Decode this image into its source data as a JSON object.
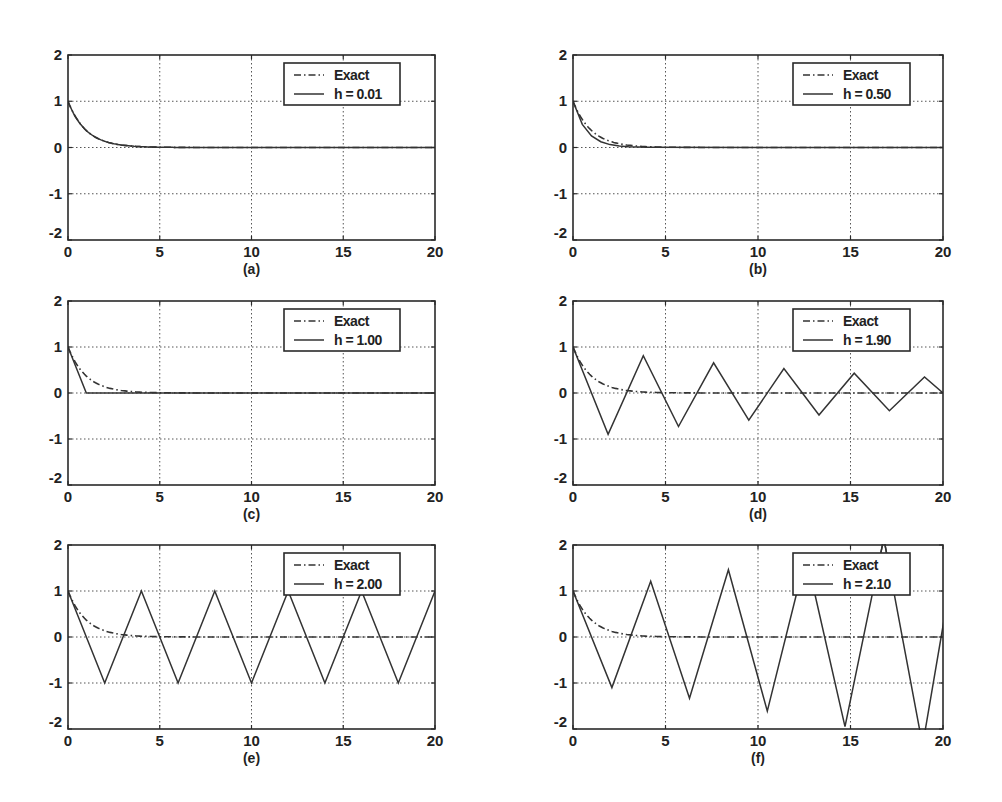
{
  "figure": {
    "legend_exact_label": "Exact"
  },
  "chart_data": [
    {
      "type": "line",
      "caption": "(a)",
      "xlim": [
        0,
        20
      ],
      "ylim": [
        -2,
        2
      ],
      "xticks": [
        0,
        5,
        10,
        15,
        20
      ],
      "yticks": [
        -2,
        -1,
        0,
        1,
        2
      ],
      "grid": true,
      "legend_position": "upper right",
      "h": 0.01,
      "series": [
        {
          "name": "Exact",
          "style": "dash-dot",
          "function": "exp(-t)"
        },
        {
          "name": "h = 0.01",
          "style": "solid",
          "step": 0.01
        }
      ]
    },
    {
      "type": "line",
      "caption": "(b)",
      "xlim": [
        0,
        20
      ],
      "ylim": [
        -2,
        2
      ],
      "xticks": [
        0,
        5,
        10,
        15,
        20
      ],
      "yticks": [
        -2,
        -1,
        0,
        1,
        2
      ],
      "grid": true,
      "legend_position": "upper right",
      "h": 0.5,
      "series": [
        {
          "name": "Exact",
          "style": "dash-dot",
          "function": "exp(-t)"
        },
        {
          "name": "h = 0.50",
          "style": "solid",
          "step": 0.5,
          "points": [
            [
              0,
              1
            ],
            [
              0.5,
              0.5
            ],
            [
              1,
              0.25
            ],
            [
              1.5,
              0.125
            ],
            [
              2,
              0.0625
            ],
            [
              2.5,
              0.03125
            ],
            [
              3,
              0.0156
            ],
            [
              3.5,
              0.0078
            ],
            [
              4,
              0.0039
            ],
            [
              20,
              0
            ]
          ]
        }
      ]
    },
    {
      "type": "line",
      "caption": "(c)",
      "xlim": [
        0,
        20
      ],
      "ylim": [
        -2,
        2
      ],
      "xticks": [
        0,
        5,
        10,
        15,
        20
      ],
      "yticks": [
        -2,
        -1,
        0,
        1,
        2
      ],
      "grid": true,
      "legend_position": "upper right",
      "h": 1.0,
      "series": [
        {
          "name": "Exact",
          "style": "dash-dot",
          "function": "exp(-t)"
        },
        {
          "name": "h = 1.00",
          "style": "solid",
          "step": 1.0,
          "points": [
            [
              0,
              1
            ],
            [
              1,
              0
            ],
            [
              20,
              0
            ]
          ]
        }
      ]
    },
    {
      "type": "line",
      "caption": "(d)",
      "xlim": [
        0,
        20
      ],
      "ylim": [
        -2,
        2
      ],
      "xticks": [
        0,
        5,
        10,
        15,
        20
      ],
      "yticks": [
        -2,
        -1,
        0,
        1,
        2
      ],
      "grid": true,
      "legend_position": "upper right",
      "h": 1.9,
      "series": [
        {
          "name": "Exact",
          "style": "dash-dot",
          "function": "exp(-t)"
        },
        {
          "name": "h = 1.90",
          "style": "solid",
          "step": 1.9,
          "points": [
            [
              0,
              1
            ],
            [
              1.9,
              -0.9
            ],
            [
              3.8,
              0.81
            ],
            [
              5.7,
              -0.729
            ],
            [
              7.6,
              0.656
            ],
            [
              9.5,
              -0.59
            ],
            [
              11.4,
              0.531
            ],
            [
              13.3,
              -0.478
            ],
            [
              15.2,
              0.43
            ],
            [
              17.1,
              -0.387
            ],
            [
              19.0,
              0.349
            ],
            [
              20,
              0.0
            ]
          ]
        }
      ]
    },
    {
      "type": "line",
      "caption": "(e)",
      "xlim": [
        0,
        20
      ],
      "ylim": [
        -2,
        2
      ],
      "xticks": [
        0,
        5,
        10,
        15,
        20
      ],
      "yticks": [
        -2,
        -1,
        0,
        1,
        2
      ],
      "grid": true,
      "legend_position": "upper right",
      "h": 2.0,
      "series": [
        {
          "name": "Exact",
          "style": "dashed",
          "function": "exp(-t)"
        },
        {
          "name": "h = 2.00",
          "style": "solid",
          "step": 2.0,
          "points": [
            [
              0,
              1
            ],
            [
              2,
              -1
            ],
            [
              4,
              1
            ],
            [
              6,
              -1
            ],
            [
              8,
              1
            ],
            [
              10,
              -1
            ],
            [
              12,
              1
            ],
            [
              14,
              -1
            ],
            [
              16,
              1
            ],
            [
              18,
              -1
            ],
            [
              20,
              1
            ]
          ]
        }
      ]
    },
    {
      "type": "line",
      "caption": "(f)",
      "xlim": [
        0,
        20
      ],
      "ylim": [
        -2,
        2
      ],
      "xticks": [
        0,
        5,
        10,
        15,
        20
      ],
      "yticks": [
        -2,
        -1,
        0,
        1,
        2
      ],
      "grid": true,
      "legend_position": "upper right",
      "h": 2.1,
      "series": [
        {
          "name": "Exact",
          "style": "dash-dot",
          "function": "exp(-t)"
        },
        {
          "name": "h = 2.10",
          "style": "solid",
          "step": 2.1,
          "points": [
            [
              0,
              1
            ],
            [
              2.1,
              -1.1
            ],
            [
              4.2,
              1.21
            ],
            [
              6.3,
              -1.331
            ],
            [
              8.4,
              1.464
            ],
            [
              10.5,
              -1.611
            ],
            [
              12.6,
              1.772
            ],
            [
              14.7,
              -1.949
            ],
            [
              16.8,
              2.144
            ],
            [
              18.9,
              -2.358
            ],
            [
              21.0,
              2.594
            ]
          ]
        }
      ]
    }
  ]
}
